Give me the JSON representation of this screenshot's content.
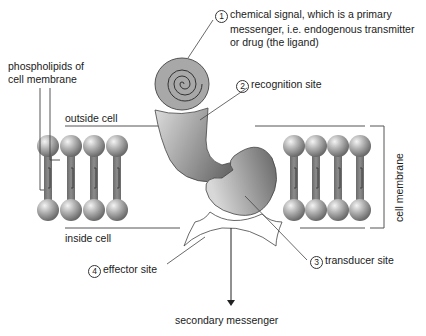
{
  "diagram": {
    "labels": {
      "chemical_signal": {
        "number": "1",
        "lines": [
          "chemical signal, which is a primary",
          "messenger, i.e. endogenous transmitter",
          "or drug (the ligand)"
        ]
      },
      "recognition_site": {
        "number": "2",
        "text": "recognition site"
      },
      "transducer_site": {
        "number": "3",
        "text": "transducer site"
      },
      "effector_site": {
        "number": "4",
        "text": "effector site"
      },
      "phospholipids": {
        "lines": [
          "phospholipids of",
          "cell membrane"
        ]
      },
      "outside_cell": "outside cell",
      "inside_cell": "inside cell",
      "cell_membrane": "cell membrane",
      "secondary_messenger": "secondary messenger"
    },
    "colors": {
      "line": "#333333",
      "lipid_head": "#9a9a9a",
      "lipid_tail": "#7a7a7a",
      "ligand": "#a8a8a8",
      "receptor_light": "#d8d8d8",
      "receptor_dark": "#707070"
    }
  }
}
